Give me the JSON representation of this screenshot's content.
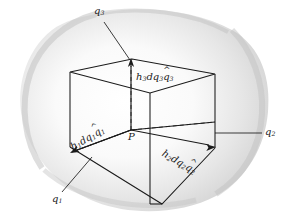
{
  "figure": {
    "type": "geometry-diagram",
    "background_patch_color": "#d9d9d9",
    "line_color": "#1a1a1a",
    "labels": {
      "point": "P",
      "axis_q1": {
        "base": "q",
        "sub": "1"
      },
      "axis_q2": {
        "base": "q",
        "sub": "2"
      },
      "axis_q3": {
        "base": "q",
        "sub": "3"
      },
      "vector_1": {
        "h": "h",
        "h_sub": "1",
        "d": "d",
        "q": "q",
        "q_sub": "1",
        "unit": "q",
        "unit_sub": "1",
        "hat": "^"
      },
      "vector_2": {
        "h": "h",
        "h_sub": "2",
        "d": "d",
        "q": "q",
        "q_sub": "2",
        "unit": "q",
        "unit_sub": "2",
        "hat": "^"
      },
      "vector_3": {
        "h": "h",
        "h_sub": "3",
        "d": "d",
        "q": "q",
        "q_sub": "3",
        "unit": "q",
        "unit_sub": "3",
        "hat": "^"
      }
    }
  }
}
